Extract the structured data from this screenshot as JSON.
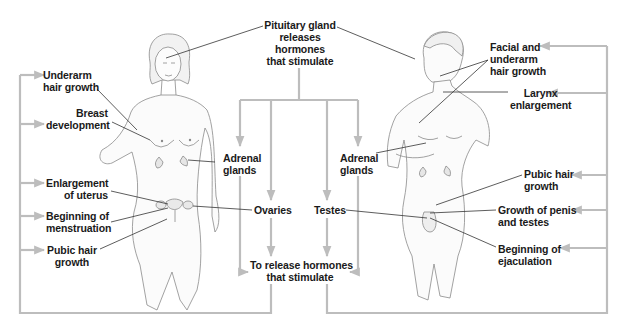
{
  "diagram": {
    "colors": {
      "background": "#ffffff",
      "text": "#1a1a1a",
      "connector": "#bdbdbd",
      "leader_line": "#333333",
      "figure_outline": "#8a8a8a"
    },
    "top": {
      "lines": [
        "Pituitary gland",
        "releases",
        "hormones",
        "that stimulate"
      ]
    },
    "middle": {
      "adrenal_left": {
        "lines": [
          "Adrenal",
          "glands"
        ]
      },
      "adrenal_right": {
        "lines": [
          "Adrenal",
          "glands"
        ]
      },
      "ovaries": "Ovaries",
      "testes": "Testes",
      "release": {
        "lines": [
          "To release hormones",
          "that stimulate"
        ]
      }
    },
    "female": {
      "figure": "female-body",
      "effects": [
        {
          "lines": [
            "Underarm",
            "hair growth"
          ]
        },
        {
          "lines": [
            "Breast",
            "development"
          ]
        },
        {
          "lines": [
            "Enlargement",
            "of uterus"
          ]
        },
        {
          "lines": [
            "Beginning of",
            "menstruation"
          ]
        },
        {
          "lines": [
            "Pubic hair",
            "growth"
          ]
        }
      ]
    },
    "male": {
      "figure": "male-body",
      "effects": [
        {
          "lines": [
            "Facial and",
            "underarm",
            "hair growth"
          ]
        },
        {
          "lines": [
            "Larynx",
            "enlargement"
          ]
        },
        {
          "lines": [
            "Pubic hair",
            "growth"
          ]
        },
        {
          "lines": [
            "Growth of penis",
            "and testes"
          ]
        },
        {
          "lines": [
            "Beginning of",
            "ejaculation"
          ]
        }
      ]
    }
  }
}
